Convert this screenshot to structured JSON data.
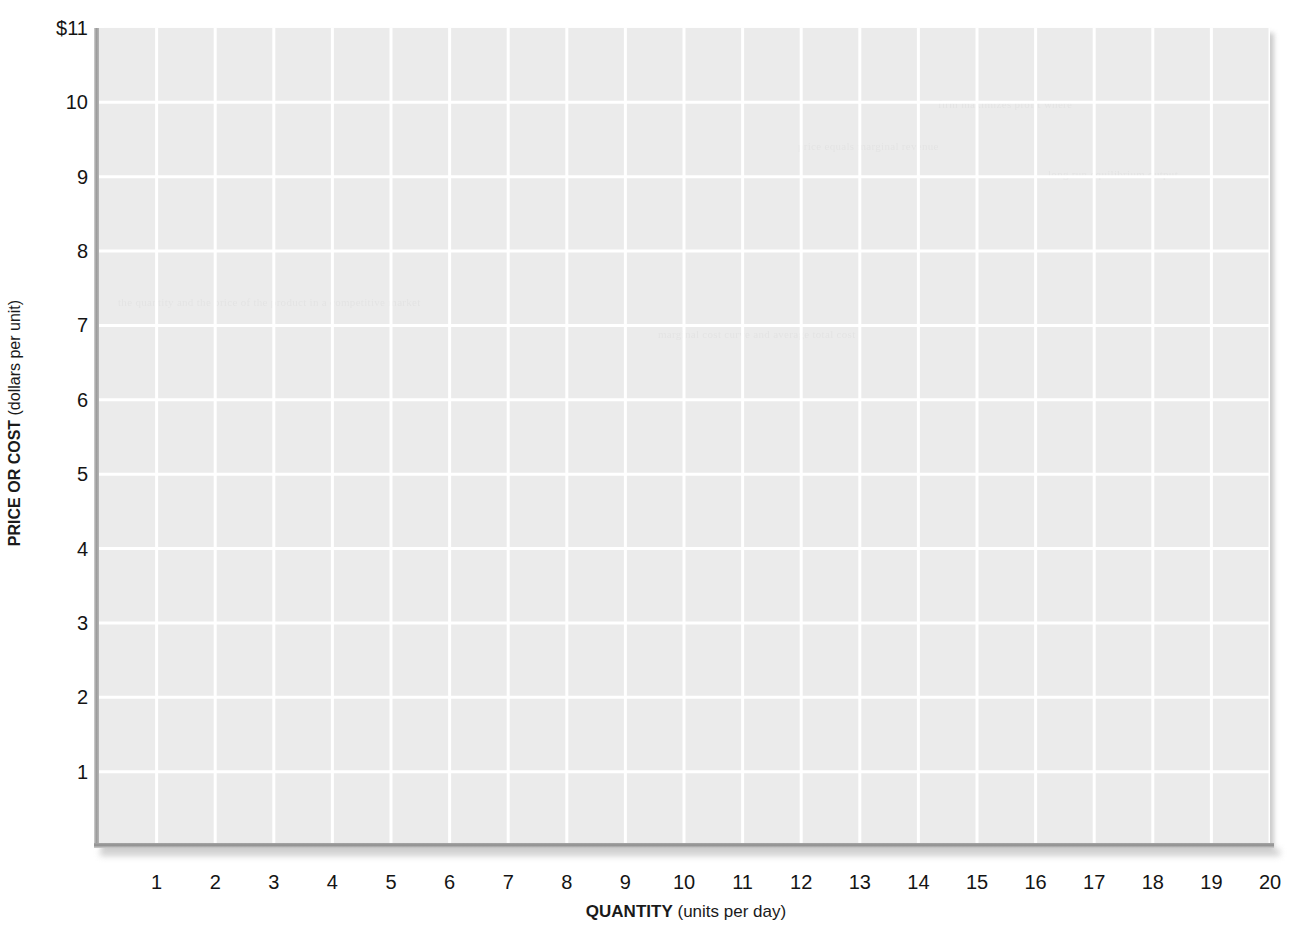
{
  "chart_data": {
    "type": "line",
    "title": "",
    "subtitle": "",
    "xlabel_bold": "QUANTITY",
    "xlabel_sub": "(units per day)",
    "ylabel_bold": "PRICE OR COST",
    "ylabel_sub": "(dollars per unit)",
    "xlim": [
      0,
      20
    ],
    "ylim": [
      0,
      11
    ],
    "xticks": [
      1,
      2,
      3,
      4,
      5,
      6,
      7,
      8,
      9,
      10,
      11,
      12,
      13,
      14,
      15,
      16,
      17,
      18,
      19,
      20
    ],
    "xtick_labels": [
      "1",
      "2",
      "3",
      "4",
      "5",
      "6",
      "7",
      "8",
      "9",
      "10",
      "11",
      "12",
      "13",
      "14",
      "15",
      "16",
      "17",
      "18",
      "19",
      "20"
    ],
    "yticks": [
      1,
      2,
      3,
      4,
      5,
      6,
      7,
      8,
      9,
      10,
      11
    ],
    "ytick_labels": [
      "1",
      "2",
      "3",
      "4",
      "5",
      "6",
      "7",
      "8",
      "9",
      "10",
      "$11"
    ],
    "series": [],
    "legend": [],
    "legend_position": "none",
    "annotations": [],
    "grid": true,
    "grid_color": "#ffffff",
    "plot_background": "#ebebeb",
    "page_background": "#ffffff",
    "axis_color": "#9a9a9a",
    "text_color": "#141414",
    "note": "Blank plotting grid; no data series are drawn."
  },
  "bleed_artifacts": [
    {
      "text": "the quantity and the price of the product in a competitive market",
      "x": 20,
      "y": 268
    },
    {
      "text": "marginal cost curve and average total cost",
      "x": 560,
      "y": 300
    },
    {
      "text": "price equals marginal revenue",
      "x": 700,
      "y": 112
    },
    {
      "text": "firm maximizes profit where",
      "x": 840,
      "y": 70
    },
    {
      "text": "long run equilibrium output",
      "x": 950,
      "y": 140
    }
  ]
}
